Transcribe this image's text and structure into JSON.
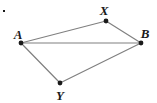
{
  "figure": {
    "background_color": "#ffffff",
    "width": 157,
    "height": 103,
    "stroke_color": "#808080",
    "vertex_color": "#1a1a1a",
    "label_color": "#1a1a1a"
  },
  "chart_data": {
    "type": "diagram",
    "title": "",
    "points": [
      {
        "id": "A",
        "label": "A",
        "x": 21,
        "y": 43,
        "label_x": 18,
        "label_y": 34
      },
      {
        "id": "X",
        "label": "X",
        "x": 106,
        "y": 21,
        "label_x": 104,
        "label_y": 10
      },
      {
        "id": "B",
        "label": "B",
        "x": 141,
        "y": 43,
        "label_x": 145,
        "label_y": 33
      },
      {
        "id": "Y",
        "label": "Y",
        "x": 60,
        "y": 83,
        "label_x": 60,
        "label_y": 95
      }
    ],
    "segments": [
      {
        "id": "AX",
        "from": "A",
        "to": "X"
      },
      {
        "id": "XB",
        "from": "X",
        "to": "B"
      },
      {
        "id": "AB",
        "from": "A",
        "to": "B"
      },
      {
        "id": "AY",
        "from": "A",
        "to": "Y"
      },
      {
        "id": "YB",
        "from": "Y",
        "to": "B"
      }
    ],
    "artifacts": [
      {
        "id": "speck",
        "x": 3,
        "y": 10,
        "size": 2
      }
    ]
  }
}
